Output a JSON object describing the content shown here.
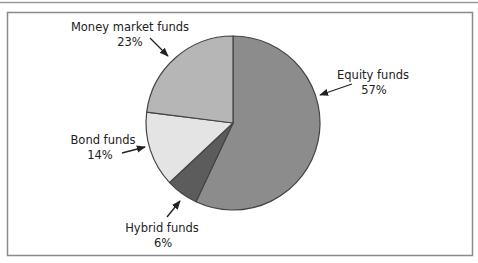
{
  "chart_data": {
    "type": "pie",
    "title": "",
    "start_angle": "12 o'clock",
    "direction": "clockwise",
    "slices": [
      {
        "label": "Equity funds",
        "value": 57,
        "value_label": "57%",
        "color": "#8c8c8c"
      },
      {
        "label": "Hybrid funds",
        "value": 6,
        "value_label": "6%",
        "color": "#5c5c5c"
      },
      {
        "label": "Bond funds",
        "value": 14,
        "value_label": "14%",
        "color": "#e4e4e4"
      },
      {
        "label": "Money market funds",
        "value": 23,
        "value_label": "23%",
        "color": "#b6b6b6"
      }
    ],
    "legend": "none",
    "annotations": "arrow callouts from labels to slices"
  },
  "colors": {
    "outline": "#444444",
    "frame": "#8a8a8a",
    "text": "#222222"
  }
}
